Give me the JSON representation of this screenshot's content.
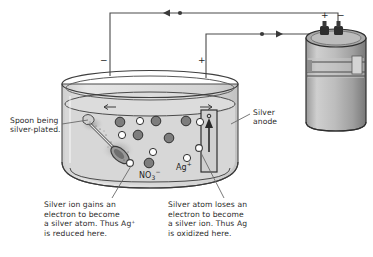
{
  "figure": {
    "type": "electroplating-cell-diagram",
    "palette": {
      "line": "#3a3a3a",
      "liquid": "#d7d7d7",
      "glass": "#efefef",
      "anion_fill": "#7d7d7d",
      "cation_fill": "#ffffff",
      "battery_body": "#b9b9b9",
      "battery_shade": "#8e8e8e",
      "battery_top": "#a8a8a8",
      "background": "#ffffff"
    }
  },
  "labels": {
    "spoon": "Spoon being\nsilver-plated.",
    "anode": "Silver\nanode",
    "cathode_sign": "−",
    "anode_sign": "+",
    "battery_positive": "+",
    "battery_negative": "−"
  },
  "ion_labels": {
    "nitrate": "NO",
    "nitrate_sub": "3",
    "nitrate_sup": "−",
    "silver": "Ag",
    "silver_sup": "+"
  },
  "captions": {
    "left": "Silver ion gains an\nelectron to become\na silver atom. Thus Ag⁺\nis reduced here.",
    "right": "Silver atom loses an\nelectron to become\na silver ion. Thus Ag\nis oxidized here."
  },
  "particles": {
    "nitrate_positions": [
      [
        120,
        122
      ],
      [
        156,
        121
      ],
      [
        186,
        121
      ],
      [
        138,
        135
      ],
      [
        169,
        138
      ],
      [
        149,
        163
      ]
    ],
    "silver_positions": [
      [
        140,
        121
      ],
      [
        200,
        122
      ],
      [
        122,
        135
      ],
      [
        153,
        152
      ],
      [
        187,
        158
      ],
      [
        204,
        148
      ]
    ]
  },
  "flow_markers": {
    "top_wire_direction": "left",
    "mid_wire_direction": "right"
  }
}
